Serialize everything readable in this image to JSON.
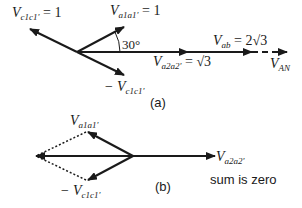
{
  "diagram_a": {
    "caption": "(a)",
    "labels": {
      "vc1c1_main": "V",
      "vc1c1_sub": "c1c1'",
      "vc1c1_eq": " = 1",
      "va1a1_main": "V",
      "va1a1_sub": "a1a1'",
      "va1a1_eq": " = 1",
      "angle": "30°",
      "neg_vc1c1_prefix": "− V",
      "neg_vc1c1_sub": "c1c1'",
      "va2a2_main": "V",
      "va2a2_sub": "a2a2'",
      "va2a2_eq": " = √3",
      "vab_main": "V",
      "vab_sub": "ab",
      "vab_eq": " = 2√3",
      "van_main": "V",
      "van_sub": "AN"
    }
  },
  "diagram_b": {
    "caption": "(b)",
    "note": "sum is zero",
    "labels": {
      "va1a1_main": "V",
      "va1a1_sub": "a1a1'",
      "neg_vc1c1_prefix": "− V",
      "neg_vc1c1_sub": "c1c1'",
      "va2a2_main": "V",
      "va2a2_sub": "a2a2'"
    }
  },
  "colors": {
    "stroke": "#1a1a1a",
    "background": "#ffffff"
  }
}
